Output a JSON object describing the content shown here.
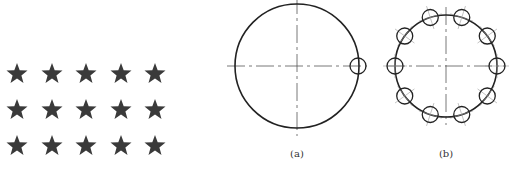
{
  "figure": {
    "star_grid": {
      "rows": 3,
      "cols": 5,
      "color": "#3a3a3a",
      "x": [
        17,
        52,
        86,
        121,
        155
      ],
      "y": [
        74,
        110,
        146
      ],
      "size": 11
    },
    "panel_a": {
      "label": "(a)",
      "center": [
        297,
        66
      ],
      "radius": 62,
      "small_circles": [
        {
          "cx": 358,
          "cy": 66,
          "r": 8
        }
      ],
      "label_pos": [
        297,
        148
      ]
    },
    "panel_b": {
      "label": "(b)",
      "center": [
        446,
        66
      ],
      "radius": 51,
      "small_circle_count": 10,
      "small_circle_radius": 8,
      "label_pos": [
        446,
        148
      ]
    },
    "stroke_color": "#222222",
    "centerline_color": "#555555"
  }
}
